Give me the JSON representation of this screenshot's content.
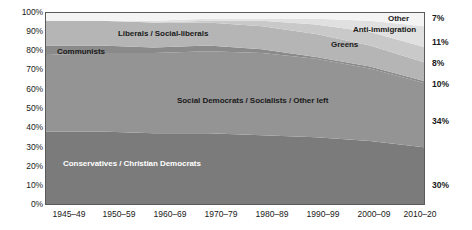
{
  "chart_data": {
    "type": "area",
    "stacked": true,
    "normalized_percent": true,
    "title": "",
    "subtitle": "",
    "xlabel": "",
    "ylabel": "",
    "ylim": [
      0,
      100
    ],
    "grid": false,
    "legend_position": "inline-labels",
    "categories": [
      "1945–49",
      "1950–59",
      "1960–69",
      "1970–79",
      "1980–89",
      "1990–99",
      "2000–09",
      "2010–20"
    ],
    "y_ticks": [
      "0%",
      "10%",
      "20%",
      "30%",
      "40%",
      "50%",
      "60%",
      "70%",
      "80%",
      "90%",
      "100%"
    ],
    "y_tick_values": [
      0,
      10,
      20,
      30,
      40,
      50,
      60,
      70,
      80,
      90,
      100
    ],
    "right_axis_annotations": [
      {
        "label": "7%",
        "value": 7,
        "series": "Other"
      },
      {
        "label": "11%",
        "value": 11,
        "series": "Anti-immigration"
      },
      {
        "label": "8%",
        "value": 8,
        "series": "Greens"
      },
      {
        "label": "10%",
        "value": 10,
        "series": "Liberals / Social-liberals"
      },
      {
        "label": "34%",
        "value": 34,
        "series": "Social Democrats / Socialists / Other left"
      },
      {
        "label": "30%",
        "value": 30,
        "series": "Conservatives / Christian Democrats"
      }
    ],
    "series": [
      {
        "name": "Conservatives / Christian Democrats",
        "color": "#7b7b7b",
        "label_color": "#ffffff",
        "values": [
          38,
          38,
          37,
          37,
          36,
          35,
          33,
          30
        ]
      },
      {
        "name": "Social Democrats / Socialists / Other left",
        "color": "#949494",
        "label_color": "#1a1a1a",
        "values": [
          40,
          41,
          42,
          43,
          43,
          41,
          38,
          34
        ]
      },
      {
        "name": "Communists",
        "color": "#8a8a8a",
        "label_color": "#1a1a1a",
        "values": [
          5,
          4,
          3,
          3,
          2,
          1,
          1,
          1
        ]
      },
      {
        "name": "Liberals / Social-liberals",
        "color": "#b5b5b5",
        "label_color": "#1a1a1a",
        "values": [
          13,
          13,
          13,
          12,
          12,
          12,
          11,
          10
        ]
      },
      {
        "name": "Greens",
        "color": "#c9c9c9",
        "label_color": "#1a1a1a",
        "values": [
          0,
          0,
          0,
          1,
          3,
          5,
          7,
          8
        ]
      },
      {
        "name": "Anti-immigration",
        "color": "#e0e0e0",
        "label_color": "#1a1a1a",
        "values": [
          0,
          0,
          1,
          1,
          1,
          3,
          6,
          11
        ]
      },
      {
        "name": "Other",
        "color": "#f4f4f4",
        "label_color": "#1a1a1a",
        "values": [
          4,
          4,
          4,
          3,
          3,
          3,
          4,
          7
        ]
      }
    ],
    "inline_labels": [
      {
        "text": "Liberals / Social-liberals",
        "series": "Liberals / Social-liberals"
      },
      {
        "text": "Communists",
        "series": "Communists"
      },
      {
        "text": "Other",
        "series": "Other"
      },
      {
        "text": "Anti-immigration",
        "series": "Anti-immigration"
      },
      {
        "text": "Greens",
        "series": "Greens"
      },
      {
        "text": "Social Democrats / Socialists / Other left",
        "series": "Social Democrats / Socialists / Other left"
      },
      {
        "text": "Conservatives / Christian Democrats",
        "series": "Conservatives / Christian Democrats"
      }
    ]
  },
  "axis": {
    "left": {
      "t0": "0%",
      "t1": "10%",
      "t2": "20%",
      "t3": "30%",
      "t4": "40%",
      "t5": "50%",
      "t6": "60%",
      "t7": "70%",
      "t8": "80%",
      "t9": "90%",
      "t10": "100%"
    },
    "right": {
      "r_other": "7%",
      "r_anti": "11%",
      "r_greens": "8%",
      "r_liberals": "10%",
      "r_socdem": "34%",
      "r_cons": "30%"
    },
    "bottom": {
      "x0": "1945–49",
      "x1": "1950–59",
      "x2": "1960–69",
      "x3": "1970–79",
      "x4": "1980–89",
      "x5": "1990–99",
      "x6": "2000–09",
      "x7": "2010–20"
    }
  },
  "labels": {
    "liberals": "Liberals / Social-liberals",
    "communists": "Communists",
    "other": "Other",
    "anti_immigration": "Anti-immigration",
    "greens": "Greens",
    "social_democrats": "Social Democrats / Socialists / Other left",
    "conservatives": "Conservatives / Christian Democrats"
  }
}
